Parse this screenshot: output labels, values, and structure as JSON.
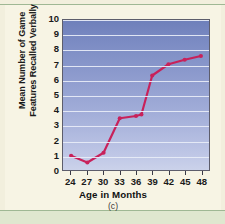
{
  "figure": {
    "caption": "(c)"
  },
  "chart_data": {
    "type": "line",
    "title": "",
    "xlabel": "Age in Months",
    "ylabel": "Mean Number of Game Features Recalled Verbally",
    "ylabel_line1": "Mean Number of Game",
    "ylabel_line2": "Features Recalled Verbally",
    "xlim": [
      22.5,
      49.5
    ],
    "ylim": [
      0,
      10
    ],
    "xticks": [
      24,
      27,
      30,
      33,
      36,
      39,
      42,
      45,
      48
    ],
    "yticks": [
      0,
      1,
      2,
      3,
      4,
      5,
      6,
      7,
      8,
      9,
      10
    ],
    "grid": "horizontal",
    "legend": "none",
    "series": [
      {
        "name": "Mean game features recalled verbally",
        "color": "#c8215a",
        "marker": "circle",
        "x": [
          24,
          27,
          30,
          33,
          36,
          37,
          39,
          42,
          45,
          48
        ],
        "y": [
          0.95,
          0.5,
          1.15,
          3.45,
          3.6,
          3.7,
          6.3,
          7.05,
          7.35,
          7.6
        ]
      }
    ]
  },
  "colors": {
    "line": "#c8215a",
    "plot_top": "#6e7fba",
    "plot_bottom": "#cbd2ea",
    "gridline": "#e8edf7",
    "page": "#f7f4e4",
    "page_edge": "#f2efdd",
    "rule": "#9fb894",
    "band": "#dfe7cf",
    "text": "#1a1a1a"
  }
}
